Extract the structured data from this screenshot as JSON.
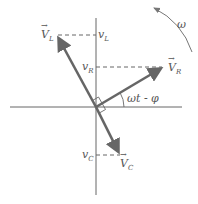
{
  "diagram": {
    "type": "phasor-diagram",
    "labels": {
      "VL_vec": {
        "base": "V",
        "sub": "L"
      },
      "VR_vec": {
        "base": "V",
        "sub": "R"
      },
      "VC_vec": {
        "base": "V",
        "sub": "C"
      },
      "vL_proj": {
        "base": "v",
        "sub": "L"
      },
      "vR_proj": {
        "base": "v",
        "sub": "R"
      },
      "vC_proj": {
        "base": "v",
        "sub": "C"
      },
      "angle": "ωt - φ",
      "omega": "ω"
    },
    "colors": {
      "axis": "#555555",
      "phasor": "#666666",
      "dash": "#666666",
      "text": "#555555"
    },
    "geometry": {
      "origin": [
        96,
        107
      ],
      "VL_tip": [
        57,
        35
      ],
      "VR_tip": [
        164,
        67
      ],
      "VC_tip": [
        120,
        155
      ]
    }
  }
}
